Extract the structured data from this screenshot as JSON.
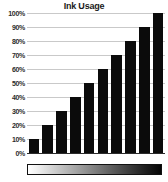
{
  "chart_data": {
    "type": "bar",
    "title": "Ink Usage",
    "xlabel": "",
    "ylabel": "",
    "categories": [
      "1",
      "2",
      "3",
      "4",
      "5",
      "6",
      "7",
      "8",
      "9",
      "10"
    ],
    "values": [
      10,
      20,
      30,
      40,
      50,
      60,
      70,
      80,
      90,
      100
    ],
    "ylim": [
      0,
      100
    ],
    "ytick_labels": [
      "100%",
      "90%",
      "80%",
      "70%",
      "60%",
      "50%",
      "40%",
      "30%",
      "20%",
      "10%",
      "0%"
    ],
    "ytick_values": [
      100,
      90,
      80,
      70,
      60,
      50,
      40,
      30,
      20,
      10,
      0
    ],
    "grid": true,
    "legend": "none",
    "bar_color": "#0b0b0b",
    "gridline_color": "#c9c9c9",
    "background_color": "#ffffff",
    "annotations": {
      "gradient_legend": {
        "from_color": "#ffffff",
        "to_color": "#050505",
        "label": ""
      }
    }
  }
}
